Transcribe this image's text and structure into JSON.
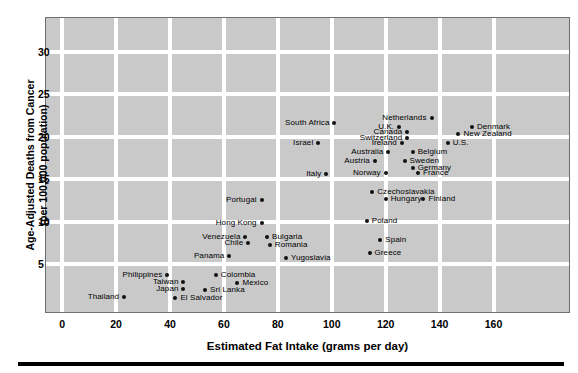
{
  "chart_data": {
    "type": "scatter",
    "title": "",
    "xlabel": "Estimated Fat Intake (grams per day)",
    "ylabel_line1": "Age-Adjusted Deaths from Cancer",
    "ylabel_line2": "(per 100,000 population)",
    "xlim": [
      -6,
      188
    ],
    "ylim": [
      -0.6,
      34
    ],
    "xticks": [
      0,
      20,
      40,
      60,
      80,
      100,
      120,
      140,
      160
    ],
    "yticks": [
      5,
      10,
      15,
      20,
      25,
      30
    ],
    "grid": true,
    "legend": "none",
    "background_color": "#c9c9c9",
    "grid_color": "#ffffff",
    "point_color": "#111111",
    "points": [
      {
        "name": "South Africa",
        "x": 101,
        "y": 21.6,
        "side": "left"
      },
      {
        "name": "Netherlands",
        "x": 137,
        "y": 22.2,
        "side": "left"
      },
      {
        "name": "Denmark",
        "x": 152,
        "y": 21.2,
        "side": "right"
      },
      {
        "name": "New Zealand",
        "x": 147,
        "y": 20.4,
        "side": "right"
      },
      {
        "name": "U.K.",
        "x": 125,
        "y": 21.2,
        "side": "left"
      },
      {
        "name": "Canada",
        "x": 128,
        "y": 20.6,
        "side": "left"
      },
      {
        "name": "Switzerland",
        "x": 128,
        "y": 19.9,
        "side": "left"
      },
      {
        "name": "Ireland",
        "x": 126,
        "y": 19.3,
        "side": "left"
      },
      {
        "name": "Israel",
        "x": 95,
        "y": 19.3,
        "side": "left"
      },
      {
        "name": "U.S.",
        "x": 143,
        "y": 19.3,
        "side": "right"
      },
      {
        "name": "Australia",
        "x": 121,
        "y": 18.2,
        "side": "left"
      },
      {
        "name": "Belgium",
        "x": 130,
        "y": 18.2,
        "side": "right"
      },
      {
        "name": "Austria",
        "x": 116,
        "y": 17.2,
        "side": "left"
      },
      {
        "name": "Sweden",
        "x": 127,
        "y": 17.2,
        "side": "right"
      },
      {
        "name": "Germany",
        "x": 130,
        "y": 16.4,
        "side": "right"
      },
      {
        "name": "Norway",
        "x": 120,
        "y": 15.7,
        "side": "left"
      },
      {
        "name": "France",
        "x": 132,
        "y": 15.7,
        "side": "right"
      },
      {
        "name": "Italy",
        "x": 98,
        "y": 15.6,
        "side": "left"
      },
      {
        "name": "Czechoslavakia",
        "x": 115,
        "y": 13.5,
        "side": "right"
      },
      {
        "name": "Hungary",
        "x": 120,
        "y": 12.7,
        "side": "right"
      },
      {
        "name": "Finland",
        "x": 134,
        "y": 12.7,
        "side": "right"
      },
      {
        "name": "Portugal",
        "x": 74,
        "y": 12.6,
        "side": "left"
      },
      {
        "name": "Poland",
        "x": 113,
        "y": 10.1,
        "side": "right"
      },
      {
        "name": "Hong Kong",
        "x": 74,
        "y": 9.9,
        "side": "left"
      },
      {
        "name": "Venezuela",
        "x": 68,
        "y": 8.2,
        "side": "left"
      },
      {
        "name": "Bulgaria",
        "x": 76,
        "y": 8.2,
        "side": "right"
      },
      {
        "name": "Chile",
        "x": 69,
        "y": 7.5,
        "side": "left"
      },
      {
        "name": "Romania",
        "x": 77,
        "y": 7.3,
        "side": "right"
      },
      {
        "name": "Spain",
        "x": 118,
        "y": 7.9,
        "side": "right"
      },
      {
        "name": "Greece",
        "x": 114,
        "y": 6.3,
        "side": "right"
      },
      {
        "name": "Panama",
        "x": 62,
        "y": 6.0,
        "side": "left"
      },
      {
        "name": "Yugoslavia",
        "x": 83,
        "y": 5.7,
        "side": "right"
      },
      {
        "name": "Philippines",
        "x": 39,
        "y": 3.7,
        "side": "left"
      },
      {
        "name": "Colombia",
        "x": 57,
        "y": 3.7,
        "side": "right"
      },
      {
        "name": "Taiwan",
        "x": 45,
        "y": 2.9,
        "side": "left"
      },
      {
        "name": "Mexico",
        "x": 65,
        "y": 2.8,
        "side": "right"
      },
      {
        "name": "Japan",
        "x": 45,
        "y": 2.1,
        "side": "left"
      },
      {
        "name": "Sri Lanka",
        "x": 53,
        "y": 2.0,
        "side": "right"
      },
      {
        "name": "Thailand",
        "x": 23,
        "y": 1.2,
        "side": "left"
      },
      {
        "name": "El Salvador",
        "x": 42,
        "y": 1.1,
        "side": "right"
      }
    ]
  },
  "axis": {
    "x_title": "Estimated Fat Intake (grams per day)",
    "y_title_line1": "Age-Adjusted Deaths from Cancer",
    "y_title_line2": "(per 100,000 population)"
  }
}
